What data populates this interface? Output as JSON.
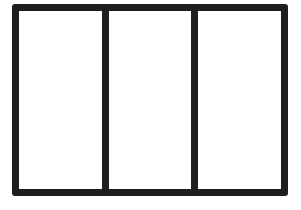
{
  "diagram": {
    "type": "three-panel-frame",
    "panels": [
      {
        "label": ""
      },
      {
        "label": ""
      },
      {
        "label": ""
      }
    ],
    "stroke_color": "#1e1e1e",
    "fill_color": "#ffffff",
    "background_color": "#ffffff"
  }
}
